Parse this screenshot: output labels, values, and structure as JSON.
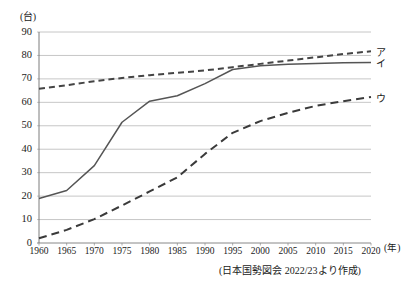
{
  "chart_data": {
    "type": "line",
    "title": "",
    "subtitle": "",
    "xlabel": "(年)",
    "ylabel": "(台)",
    "xlim": [
      1960,
      2020
    ],
    "ylim": [
      0,
      90
    ],
    "grid": true,
    "legend_position": "right-inline",
    "x": [
      1960,
      1965,
      1970,
      1975,
      1980,
      1985,
      1990,
      1995,
      2000,
      2005,
      2010,
      2015,
      2020
    ],
    "xticks": [
      "1960",
      "1965",
      "1970",
      "1975",
      "1980",
      "1985",
      "1990",
      "1995",
      "2000",
      "2005",
      "2010",
      "2015",
      "2020"
    ],
    "yticks": [
      "0",
      "10",
      "20",
      "30",
      "40",
      "50",
      "60",
      "70",
      "80",
      "90"
    ],
    "series": [
      {
        "name": "ア",
        "style": "dashed",
        "color": "#444444",
        "values": [
          65.8,
          67.3,
          69.0,
          70.4,
          71.6,
          72.6,
          73.6,
          75.0,
          76.4,
          77.8,
          79.2,
          80.6,
          81.8
        ]
      },
      {
        "name": "イ",
        "style": "solid",
        "color": "#555555",
        "values": [
          19.0,
          22.4,
          33.0,
          51.5,
          60.5,
          62.8,
          68.0,
          74.0,
          75.6,
          76.2,
          76.6,
          76.9,
          77.0
        ]
      },
      {
        "name": "ウ",
        "style": "dashed",
        "color": "#3a3a3a",
        "values": [
          2.0,
          5.6,
          10.2,
          16.0,
          22.0,
          28.0,
          38.0,
          47.0,
          52.0,
          55.5,
          58.5,
          60.5,
          62.3
        ]
      }
    ],
    "source_note": "(日本国勢図会 2022/23より作成)"
  },
  "axis": {
    "y_unit_label": "(台)",
    "x_unit_label": "(年)"
  }
}
